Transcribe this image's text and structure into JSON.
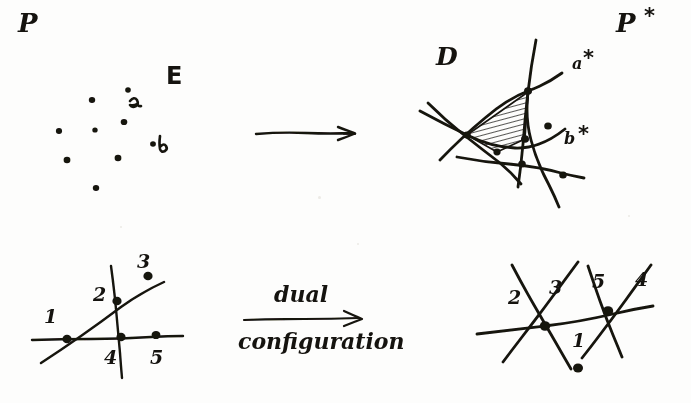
{
  "figure": {
    "ink_color": "#15130f",
    "paper_color": "#fdfdfc"
  },
  "top_left": {
    "plane_label": "P",
    "set_label": "E",
    "point_a_label": "a",
    "point_b_label": "b",
    "points": [
      {
        "x": 92,
        "y": 100
      },
      {
        "x": 128,
        "y": 90
      },
      {
        "x": 59,
        "y": 131
      },
      {
        "x": 95,
        "y": 130
      },
      {
        "x": 124,
        "y": 122
      },
      {
        "x": 153,
        "y": 144
      },
      {
        "x": 67,
        "y": 160
      },
      {
        "x": 118,
        "y": 158
      },
      {
        "x": 96,
        "y": 188
      }
    ]
  },
  "top_arrow": {
    "label": "",
    "from_x": 255,
    "to_x": 356,
    "y": 133
  },
  "top_right": {
    "plane_label": "P",
    "plane_star": "*",
    "cell_label": "D",
    "line_a_label": "a",
    "line_a_star": "*",
    "line_b_label": "b",
    "line_b_star": "*"
  },
  "middle_arrow": {
    "label_above": "dual",
    "label_below": "configuration",
    "from_x": 243,
    "to_x": 365,
    "y": 320
  },
  "bottom_left": {
    "point_labels": [
      "1",
      "2",
      "3",
      "4",
      "5"
    ],
    "points": [
      {
        "id": "1",
        "x": 67,
        "y": 339
      },
      {
        "id": "2",
        "x": 116,
        "y": 301
      },
      {
        "id": "3",
        "x": 148,
        "y": 276
      },
      {
        "id": "4",
        "x": 121,
        "y": 337
      },
      {
        "id": "5",
        "x": 155,
        "y": 336
      }
    ]
  },
  "bottom_right": {
    "line_labels": [
      "1",
      "2",
      "3",
      "4",
      "5"
    ],
    "vertices": [
      {
        "x": 545,
        "y": 325
      },
      {
        "x": 608,
        "y": 311
      },
      {
        "x": 578,
        "y": 368
      }
    ]
  }
}
